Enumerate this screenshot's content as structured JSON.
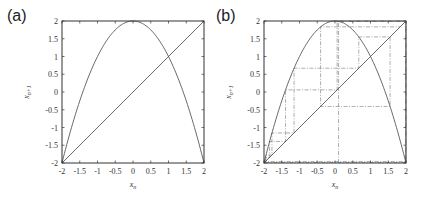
{
  "chart_data": [
    {
      "type": "line",
      "panel_label": "(a)",
      "title": "",
      "xlabel": "x_n",
      "ylabel": "x_{n+1}",
      "xlim": [
        -2,
        2
      ],
      "ylim": [
        -2,
        2
      ],
      "xticks": [
        "-2",
        "-1.5",
        "-1",
        "-0.5",
        "0",
        "0.5",
        "1",
        "1.5",
        "2"
      ],
      "yticks": [
        "-2",
        "-1.5",
        "-1",
        "-0.5",
        "0",
        "0.5",
        "1",
        "1.5",
        "2"
      ],
      "grid": false,
      "series": [
        {
          "name": "map",
          "function": "x_{n+1} = 2 - x_n^2",
          "x": [
            -2,
            -1.5,
            -1,
            -0.5,
            0,
            0.5,
            1,
            1.5,
            2
          ],
          "values": [
            -2,
            -0.25,
            1,
            1.75,
            2,
            1.75,
            1,
            -0.25,
            -2
          ]
        },
        {
          "name": "identity",
          "function": "x_{n+1} = x_n",
          "x": [
            -2,
            2
          ],
          "values": [
            -2,
            2
          ]
        }
      ]
    },
    {
      "type": "line",
      "panel_label": "(b)",
      "title": "",
      "xlabel": "x_n",
      "ylabel": "x_{n+1}",
      "xlim": [
        -2,
        2
      ],
      "ylim": [
        -2,
        2
      ],
      "xticks": [
        "-2",
        "-1.5",
        "-1",
        "-0.5",
        "0",
        "0.5",
        "1",
        "1.5",
        "2"
      ],
      "yticks": [
        "-2",
        "-1.5",
        "-1",
        "-0.5",
        "0",
        "0.5",
        "1",
        "1.5",
        "2"
      ],
      "grid": false,
      "series": [
        {
          "name": "map",
          "function": "x_{n+1} = 2 - x_n^2",
          "x": [
            -2,
            -1.5,
            -1,
            -0.5,
            0,
            0.5,
            1,
            1.5,
            2
          ],
          "values": [
            -2,
            -0.25,
            1,
            1.75,
            2,
            1.75,
            1,
            -0.25,
            -2
          ]
        },
        {
          "name": "identity",
          "function": "x_{n+1} = x_n",
          "x": [
            -2,
            2
          ],
          "values": [
            -2,
            2
          ]
        },
        {
          "name": "cobweb",
          "style": "dash-dot",
          "orbit": [
            0.1,
            1.99,
            -1.9601,
            -1.84199,
            -1.39293,
            0.05975,
            1.99643,
            -1.98573,
            -1.94313,
            -1.77575,
            -1.15329,
            0.66992,
            1.55121,
            -0.40625,
            1.83496
          ]
        }
      ]
    }
  ],
  "colors": {
    "curve": "#444444",
    "axis": "#333333",
    "cobweb": "#888888"
  }
}
